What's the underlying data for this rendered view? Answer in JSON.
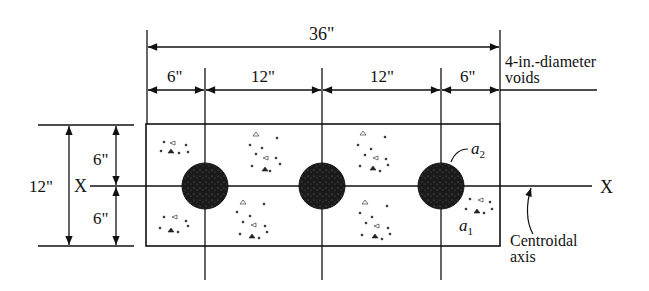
{
  "diagram": {
    "type": "cross-section with voids",
    "dimensions": {
      "overall_width": "36\"",
      "segments": [
        "6\"",
        "12\"",
        "12\"",
        "6\""
      ],
      "overall_height": "12\"",
      "half_heights": [
        "6\"",
        "6\""
      ]
    },
    "labels": {
      "voids_line1": "4-in.-diameter",
      "voids_line2": "voids",
      "axis_left": "X",
      "axis_right": "X",
      "a2_base": "a",
      "a2_sub": "2",
      "a1_base": "a",
      "a1_sub": "1",
      "centroidal_line1": "Centroidal",
      "centroidal_line2": "axis"
    },
    "voids": [
      {
        "cx": 205,
        "cy": 186,
        "r": 23
      },
      {
        "cx": 322,
        "cy": 186,
        "r": 23
      },
      {
        "cx": 441,
        "cy": 186,
        "r": 23
      }
    ],
    "colors": {
      "line": "#111111",
      "void": "#1a1a1a",
      "background": "#ffffff"
    }
  }
}
